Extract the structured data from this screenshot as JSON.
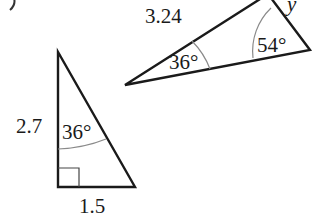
{
  "figure": {
    "part_label": "(b)",
    "small_triangle": {
      "side_vertical": "2.7",
      "side_base": "1.5",
      "angle_top": "36°",
      "right_angle": true
    },
    "large_triangle": {
      "side_hypotenuse": "3.24",
      "angle_left": "36°",
      "angle_right": "54°",
      "unknown_side": "y"
    },
    "colors": {
      "stroke": "#1a1a1a",
      "arc": "#8a8a8a",
      "background": "#ffffff"
    }
  }
}
